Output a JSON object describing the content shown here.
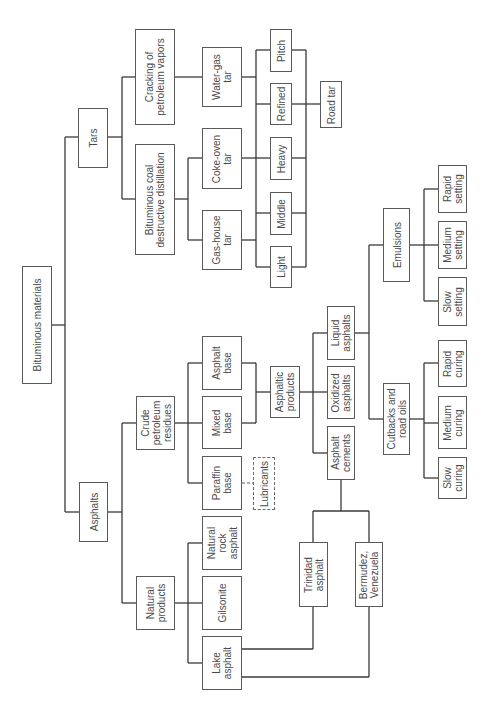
{
  "diagram": {
    "type": "tree",
    "orientation": "rotated-90-ccw",
    "line_color": "#3a3a3a",
    "text_color": "#4a4a4a",
    "nodes": {
      "bituminous_materials": "Bituminous materials",
      "tars": "Tars",
      "asphalts": "Asphalts",
      "cracking": "Cracking of\npetroleum vapors",
      "bituminous_coal": "Bituminous coal\ndestructive distillation",
      "water_gas_tar": "Water-gas\ntar",
      "coke_oven_tar": "Coke-oven\ntar",
      "gas_house_tar": "Gas-house\ntar",
      "pitch": "Pitch",
      "refined": "Refined",
      "heavy": "Heavy",
      "middle": "Middle",
      "light": "Light",
      "road_tar": "Road tar",
      "crude_petroleum": "Crude\npetroleum\nresidues",
      "natural_products": "Natural\nproducts",
      "asphalt_base": "Asphalt\nbase",
      "mixed_base": "Mixed\nbase",
      "paraffin_base": "Paraffin\nbase",
      "lubricants": "Lubricants",
      "natural_rock_asphalt": "Natural\nrock\nasphalt",
      "gilsonite": "Gilsonite",
      "lake_asphalt": "Lake\nasphalt",
      "asphaltic_products": "Asphaltic\nproducts",
      "liquid_asphalts": "Liquid\nasphalts",
      "oxidized_asphalts": "Oxidized\nasphalts",
      "asphalt_cements": "Asphalt\ncements",
      "trinidad_asphalt": "Trinidad\nasphalt",
      "bermudez": "Bermudez,\nVenezuela",
      "emulsions": "Emulsions",
      "cutbacks": "Cutbacks and\nroad oils",
      "rapid_setting": "Rapid\nsetting",
      "medium_setting": "Medium\nsetting",
      "slow_setting": "Slow\nsetting",
      "rapid_curing": "Rapid\ncuring",
      "medium_curing": "Medium\ncuring",
      "slow_curing": "Slow\ncuring"
    },
    "edges": [
      [
        "Bituminous materials",
        "Tars"
      ],
      [
        "Bituminous materials",
        "Asphalts"
      ],
      [
        "Tars",
        "Cracking of petroleum vapors"
      ],
      [
        "Tars",
        "Bituminous coal destructive distillation"
      ],
      [
        "Cracking of petroleum vapors",
        "Water-gas tar"
      ],
      [
        "Bituminous coal destructive distillation",
        "Coke-oven tar"
      ],
      [
        "Bituminous coal destructive distillation",
        "Gas-house tar"
      ],
      [
        "Tar sources",
        "Pitch"
      ],
      [
        "Tar sources",
        "Refined"
      ],
      [
        "Tar sources",
        "Heavy"
      ],
      [
        "Tar sources",
        "Middle"
      ],
      [
        "Tar sources",
        "Light"
      ],
      [
        "Refined/Heavy/Middle/Light/Pitch",
        "Road tar"
      ],
      [
        "Asphalts",
        "Crude petroleum residues"
      ],
      [
        "Asphalts",
        "Natural products"
      ],
      [
        "Crude petroleum residues",
        "Asphalt base"
      ],
      [
        "Crude petroleum residues",
        "Mixed base"
      ],
      [
        "Crude petroleum residues",
        "Paraffin base"
      ],
      [
        "Paraffin base",
        "Lubricants"
      ],
      [
        "Natural products",
        "Natural rock asphalt"
      ],
      [
        "Natural products",
        "Gilsonite"
      ],
      [
        "Natural products",
        "Lake asphalt"
      ],
      [
        "Asphalt base + Mixed base",
        "Asphaltic products"
      ],
      [
        "Asphaltic products",
        "Liquid asphalts"
      ],
      [
        "Asphaltic products",
        "Oxidized asphalts"
      ],
      [
        "Asphaltic products",
        "Asphalt cements"
      ],
      [
        "Lake asphalt",
        "Trinidad asphalt"
      ],
      [
        "Lake asphalt",
        "Bermudez, Venezuela"
      ],
      [
        "Trinidad asphalt + Bermudez, Venezuela",
        "Asphalt cements"
      ],
      [
        "Liquid asphalts",
        "Emulsions"
      ],
      [
        "Liquid asphalts",
        "Cutbacks and road oils"
      ],
      [
        "Emulsions",
        "Rapid setting"
      ],
      [
        "Emulsions",
        "Medium setting"
      ],
      [
        "Emulsions",
        "Slow setting"
      ],
      [
        "Cutbacks and road oils",
        "Rapid curing"
      ],
      [
        "Cutbacks and road oils",
        "Medium curing"
      ],
      [
        "Cutbacks and road oils",
        "Slow curing"
      ]
    ]
  }
}
